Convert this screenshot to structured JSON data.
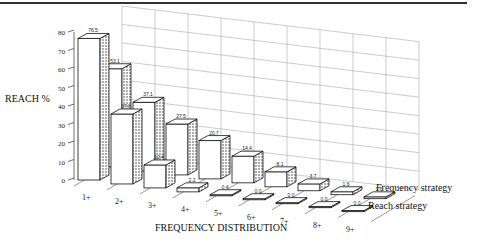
{
  "chart_data": {
    "type": "bar",
    "title": "",
    "xlabel": "FREQUENCY DISTRIBUTION",
    "ylabel": "REACH %",
    "ylim": [
      0,
      80
    ],
    "yticks": [
      0,
      10,
      20,
      30,
      40,
      50,
      60,
      70,
      80
    ],
    "categories": [
      "1+",
      "2+",
      "3+",
      "4+",
      "5+",
      "6+",
      "7+",
      "8+",
      "9+"
    ],
    "series": [
      {
        "name": "Frequency strategy",
        "values": [
          53.1,
          37.1,
          27.5,
          20.7,
          14.4,
          8.1,
          3.7,
          1.6,
          1.0
        ]
      },
      {
        "name": "Reach strategy",
        "values": [
          76.5,
          37.8,
          12.4,
          2.2,
          0.4,
          0.0,
          0.0,
          0.0,
          0.0
        ]
      }
    ],
    "grid": true,
    "legend_position": "right",
    "style": "3d-bar"
  },
  "labels": {
    "ylabel": "REACH %",
    "xlabel": "FREQUENCY DISTRIBUTION",
    "legend_frequency": "Frequency strategy",
    "legend_reach": "Reach strategy"
  }
}
